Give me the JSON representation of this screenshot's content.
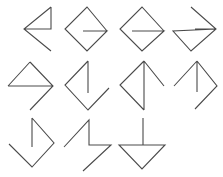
{
  "canvas": {
    "width": 223,
    "height": 177,
    "background_color": "#ffffff",
    "stroke_color": "#4a4a4a",
    "stroke_width": 1.1,
    "description": "Grid of hand-drawn-style arrow / chevron line glyphs"
  },
  "grid": {
    "columns": 4,
    "rows": 3,
    "cell_width": 55,
    "cell_height": 58,
    "occupied_cells": 11,
    "empty_cells": 1
  },
  "glyphs": [
    {
      "id": "glyph-1",
      "name": "left-arrow-with-corner-tail",
      "row": 1,
      "column": 1,
      "direction": "left",
      "origin_x": 6,
      "origin_y": 2,
      "path": "M 45 5 L 45 27 L 18 27 M 45 5 L 18 27 L 45 49"
    },
    {
      "id": "glyph-2",
      "name": "left-arrow-short-tail",
      "row": 1,
      "column": 2,
      "direction": "left",
      "origin_x": 61,
      "origin_y": 2,
      "path": "M 46 29 L 26 5 L 4 27 L 26 49 L 46 29 L 22 29"
    },
    {
      "id": "glyph-3",
      "name": "left-arrow-long-tail",
      "row": 1,
      "column": 3,
      "direction": "left",
      "origin_x": 116,
      "origin_y": 2,
      "path": "M 48 29 L 26 5 L 4 27 L 26 49 L 48 29 L 16 29"
    },
    {
      "id": "glyph-4",
      "name": "right-arrow-with-tail",
      "row": 1,
      "column": 4,
      "direction": "right",
      "origin_x": 171,
      "origin_y": 2,
      "path": "M 20 5 L 45 27 L 20 49 L 2 29 L 45 27 L 24 27"
    },
    {
      "id": "glyph-5",
      "name": "right-arrow-with-tail-lower",
      "row": 2,
      "column": 1,
      "direction": "right",
      "origin_x": 6,
      "origin_y": 58,
      "path": "M 24 4 L 47 28 L 24 52 M 47 28 L 2 28 M 24 4 L 2 28"
    },
    {
      "id": "glyph-6",
      "name": "down-arrow-with-vertical-stem",
      "row": 2,
      "column": 2,
      "direction": "down",
      "origin_x": 61,
      "origin_y": 58,
      "path": "M 27 3 L 27 35 M 27 3 L 4 27 L 27 52 L 48 30"
    },
    {
      "id": "glyph-7",
      "name": "up-arrow-with-vertical-stem",
      "row": 2,
      "column": 3,
      "direction": "up",
      "origin_x": 116,
      "origin_y": 58,
      "path": "M 28 3 L 28 52 M 28 3 L 4 27 L 28 52 M 28 3 L 48 28"
    },
    {
      "id": "glyph-8",
      "name": "up-arrow-right-chevron",
      "row": 2,
      "column": 4,
      "direction": "up",
      "origin_x": 171,
      "origin_y": 58,
      "path": "M 26 3 L 26 34 M 26 3 L 3 28 M 26 3 L 46 28 L 24 51"
    },
    {
      "id": "glyph-9",
      "name": "down-arrow-right-chevron",
      "row": 3,
      "column": 1,
      "direction": "down",
      "origin_x": 6,
      "origin_y": 115,
      "path": "M 26 3 L 26 32 M 26 3 L 48 28 L 26 52 L 3 29"
    },
    {
      "id": "glyph-10",
      "name": "zigzag-step-arrow",
      "row": 3,
      "column": 2,
      "direction": "zigzag",
      "origin_x": 61,
      "origin_y": 113,
      "path": "M 3 34 L 28 7 L 28 32 L 50 32 L 22 58"
    },
    {
      "id": "glyph-11",
      "name": "down-arrow-with-corner-stem",
      "row": 3,
      "column": 3,
      "direction": "down",
      "origin_x": 116,
      "origin_y": 113,
      "path": "M 27 5 L 27 32 L 49 32 L 26 56 L 3 32 L 27 32"
    }
  ],
  "empty_cell": {
    "name": "empty-cell-row3-col4",
    "row": 3,
    "column": 4
  }
}
